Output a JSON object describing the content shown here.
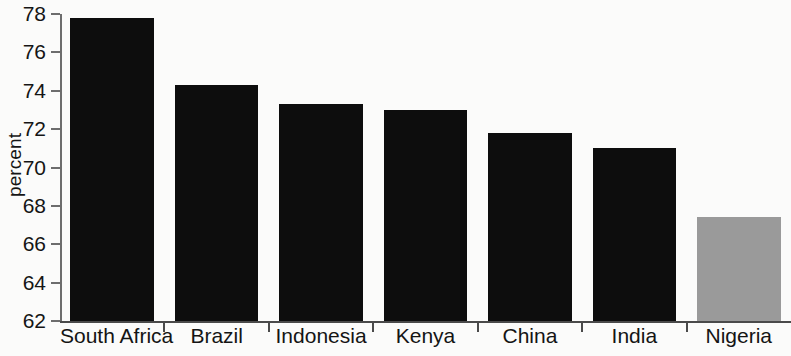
{
  "chart_data": {
    "type": "bar",
    "title": "",
    "subtitle": "",
    "xlabel": "",
    "ylabel": "percent",
    "categories": [
      "South Africa",
      "Brazil",
      "Indonesia",
      "Kenya",
      "China",
      "India",
      "Nigeria"
    ],
    "values": [
      77.8,
      74.3,
      73.3,
      73.0,
      71.8,
      71.0,
      67.4
    ],
    "series": [
      {
        "name": "percent",
        "values": [
          77.8,
          74.3,
          73.3,
          73.0,
          71.8,
          71.0,
          67.4
        ]
      }
    ],
    "bar_colors": [
      "#0d0d0d",
      "#0d0d0d",
      "#0d0d0d",
      "#0d0d0d",
      "#0d0d0d",
      "#0d0d0d",
      "#9a9a9a"
    ],
    "highlight_category": "Nigeria",
    "highlight_color": "#9a9a9a",
    "default_bar_color": "#0d0d0d",
    "ylim": [
      62,
      78
    ],
    "yticks": [
      62,
      64,
      66,
      68,
      70,
      72,
      74,
      76,
      78
    ],
    "ytick_labels": [
      "62",
      "64",
      "66",
      "68",
      "70",
      "72",
      "74",
      "76",
      "78"
    ],
    "grid": false,
    "legend": false,
    "legend_position": "none",
    "axis_color": "#4a4a4a",
    "background_color": "#fbfbfa"
  }
}
